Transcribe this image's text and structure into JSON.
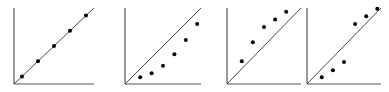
{
  "chart_data": [
    {
      "type": "scatter",
      "title": "",
      "xlabel": "",
      "ylabel": "",
      "grid": false,
      "reference_line": "y = x",
      "description": "Points lie exactly on the y=x line",
      "x": [
        0.1,
        0.3,
        0.5,
        0.7,
        0.9
      ],
      "y": [
        0.1,
        0.3,
        0.5,
        0.7,
        0.9
      ],
      "xlim": [
        0,
        1
      ],
      "ylim": [
        0,
        1
      ]
    },
    {
      "type": "scatter",
      "title": "",
      "xlabel": "",
      "ylabel": "",
      "grid": false,
      "reference_line": "y = x",
      "description": "Points lie below the y=x line",
      "x": [
        0.2,
        0.35,
        0.5,
        0.65,
        0.8,
        0.95
      ],
      "y": [
        0.09,
        0.14,
        0.24,
        0.39,
        0.58,
        0.79
      ],
      "xlim": [
        0,
        1
      ],
      "ylim": [
        0,
        1
      ]
    },
    {
      "type": "scatter",
      "title": "",
      "xlabel": "",
      "ylabel": "",
      "grid": false,
      "reference_line": "y = x",
      "description": "Points lie above the y=x line",
      "x": [
        0.2,
        0.35,
        0.5,
        0.65,
        0.8
      ],
      "y": [
        0.3,
        0.55,
        0.75,
        0.85,
        0.95
      ],
      "xlim": [
        0,
        1
      ],
      "ylim": [
        0,
        1
      ]
    },
    {
      "type": "scatter",
      "title": "",
      "xlabel": "",
      "ylabel": "",
      "grid": false,
      "reference_line": "y = x",
      "description": "Lower points below the line, upper points above the line",
      "x": [
        0.2,
        0.35,
        0.5,
        0.65,
        0.8,
        0.95
      ],
      "y": [
        0.09,
        0.18,
        0.29,
        0.79,
        0.89,
        0.99
      ],
      "xlim": [
        0,
        1
      ],
      "ylim": [
        0,
        1
      ]
    }
  ],
  "panels": [
    {
      "id": "panel-1",
      "x0": 14,
      "x1": 94,
      "y0": 84,
      "y1": 8
    },
    {
      "id": "panel-2",
      "x0": 125,
      "x1": 201,
      "y0": 84,
      "y1": 8
    },
    {
      "id": "panel-3",
      "x0": 227,
      "x1": 301,
      "y0": 84,
      "y1": 8
    },
    {
      "id": "panel-4",
      "x0": 307,
      "x1": 381,
      "y0": 84,
      "y1": 8
    }
  ],
  "colors": {
    "axis": "#555555",
    "line": "#333333",
    "point": "#000000"
  }
}
